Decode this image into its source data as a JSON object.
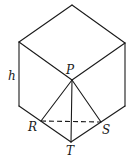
{
  "diagram": {
    "type": "geometry",
    "labels": {
      "h": "h",
      "P": "P",
      "R": "R",
      "S": "S",
      "T": "T"
    },
    "vertices": {
      "top": [
        72,
        5
      ],
      "upper_left": [
        19,
        42
      ],
      "upper_right": [
        125,
        43
      ],
      "center_P": [
        72,
        80
      ],
      "lower_left": [
        19,
        106
      ],
      "lower_right": [
        125,
        106
      ],
      "bottom_T": [
        71,
        142
      ],
      "R": [
        41,
        121
      ],
      "S": [
        101,
        122
      ]
    },
    "edges": [
      {
        "from": "top",
        "to": "upper_left",
        "style": "solid"
      },
      {
        "from": "top",
        "to": "upper_right",
        "style": "solid"
      },
      {
        "from": "upper_left",
        "to": "center_P",
        "style": "solid"
      },
      {
        "from": "upper_right",
        "to": "center_P",
        "style": "solid"
      },
      {
        "from": "upper_left",
        "to": "lower_left",
        "style": "solid"
      },
      {
        "from": "upper_right",
        "to": "lower_right",
        "style": "solid"
      },
      {
        "from": "lower_left",
        "to": "bottom_T",
        "style": "solid"
      },
      {
        "from": "lower_right",
        "to": "bottom_T",
        "style": "solid"
      },
      {
        "from": "center_P",
        "to": "bottom_T",
        "style": "solid"
      },
      {
        "from": "center_P",
        "to": "R",
        "style": "solid"
      },
      {
        "from": "center_P",
        "to": "S",
        "style": "solid"
      },
      {
        "from": "R",
        "to": "S",
        "style": "dashed"
      }
    ]
  }
}
